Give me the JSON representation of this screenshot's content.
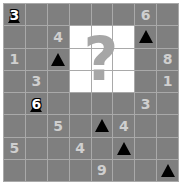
{
  "puzzle": {
    "rows": 8,
    "cols": 8,
    "hint_symbol": "?",
    "colors": {
      "cell": "#7f7f7f",
      "grid_line": "#a9a9a9",
      "number": "#cfcfcf",
      "revealed": "#ffffff",
      "mine": "#000000"
    },
    "cells": [
      [
        {
          "t": "flagnum",
          "v": "3"
        },
        {
          "t": "e"
        },
        {
          "t": "e"
        },
        {
          "t": "e"
        },
        {
          "t": "e"
        },
        {
          "t": "e"
        },
        {
          "t": "n",
          "v": "6"
        },
        {
          "t": "e"
        }
      ],
      [
        {
          "t": "e"
        },
        {
          "t": "e"
        },
        {
          "t": "n",
          "v": "4"
        },
        {
          "t": "w"
        },
        {
          "t": "w"
        },
        {
          "t": "w"
        },
        {
          "t": "m"
        },
        {
          "t": "e"
        }
      ],
      [
        {
          "t": "n",
          "v": "1"
        },
        {
          "t": "e"
        },
        {
          "t": "m"
        },
        {
          "t": "w"
        },
        {
          "t": "w"
        },
        {
          "t": "w"
        },
        {
          "t": "e"
        },
        {
          "t": "n",
          "v": "8"
        }
      ],
      [
        {
          "t": "e"
        },
        {
          "t": "n",
          "v": "3"
        },
        {
          "t": "e"
        },
        {
          "t": "w"
        },
        {
          "t": "w"
        },
        {
          "t": "w"
        },
        {
          "t": "e"
        },
        {
          "t": "n",
          "v": "1"
        }
      ],
      [
        {
          "t": "e"
        },
        {
          "t": "flagnum",
          "v": "6"
        },
        {
          "t": "e"
        },
        {
          "t": "e"
        },
        {
          "t": "e"
        },
        {
          "t": "e"
        },
        {
          "t": "n",
          "v": "3"
        },
        {
          "t": "e"
        }
      ],
      [
        {
          "t": "e"
        },
        {
          "t": "e"
        },
        {
          "t": "n",
          "v": "5"
        },
        {
          "t": "e"
        },
        {
          "t": "m"
        },
        {
          "t": "n",
          "v": "4"
        },
        {
          "t": "e"
        },
        {
          "t": "e"
        }
      ],
      [
        {
          "t": "n",
          "v": "5"
        },
        {
          "t": "e"
        },
        {
          "t": "e"
        },
        {
          "t": "n",
          "v": "4"
        },
        {
          "t": "e"
        },
        {
          "t": "m"
        },
        {
          "t": "e"
        },
        {
          "t": "e"
        }
      ],
      [
        {
          "t": "e"
        },
        {
          "t": "e"
        },
        {
          "t": "e"
        },
        {
          "t": "e"
        },
        {
          "t": "n",
          "v": "9"
        },
        {
          "t": "e"
        },
        {
          "t": "e"
        },
        {
          "t": "m"
        }
      ]
    ]
  }
}
